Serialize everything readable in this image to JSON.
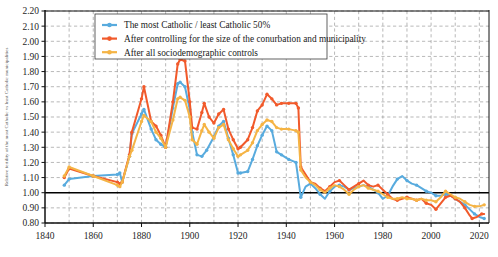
{
  "chart_data": {
    "type": "line",
    "title": "",
    "xlabel": "",
    "ylabel": "Relative fertility of the most Catholic vs least Catholic municipalities",
    "xlim": [
      1840,
      2024
    ],
    "ylim": [
      0.8,
      2.2
    ],
    "y_ticks": [
      "2.20",
      "2.10",
      "2.00",
      "1.90",
      "1.80",
      "1.70",
      "1.60",
      "1.50",
      "1.40",
      "1.30",
      "1.20",
      "1.10",
      "1.00",
      "0.90",
      "0.80"
    ],
    "x_ticks": [
      "1840",
      "1860",
      "1880",
      "1900",
      "1920",
      "1940",
      "1960",
      "1980",
      "2000",
      "2020"
    ],
    "x_minor_step": 10,
    "grid": true,
    "reference_line": 1.0,
    "legend_position": "top-center",
    "colors": {
      "series1": "#58ABDE",
      "series2": "#F15A2B",
      "series3": "#F5B445",
      "grid": "#9a9a9a",
      "axis": "#111111",
      "reference": "#000000"
    },
    "series": [
      {
        "name": "The most Catholic / least Catholic 50%",
        "color": "#58ABDE",
        "points": [
          [
            1848,
            1.05
          ],
          [
            1850,
            1.09
          ],
          [
            1860,
            1.11
          ],
          [
            1870,
            1.12
          ],
          [
            1871,
            1.13
          ],
          [
            1872,
            1.07
          ],
          [
            1875,
            1.24
          ],
          [
            1876,
            1.39
          ],
          [
            1880,
            1.52
          ],
          [
            1881,
            1.55
          ],
          [
            1884,
            1.42
          ],
          [
            1886,
            1.35
          ],
          [
            1888,
            1.32
          ],
          [
            1890,
            1.3
          ],
          [
            1893,
            1.56
          ],
          [
            1895,
            1.72
          ],
          [
            1896,
            1.73
          ],
          [
            1898,
            1.7
          ],
          [
            1900,
            1.55
          ],
          [
            1901,
            1.4
          ],
          [
            1903,
            1.25
          ],
          [
            1905,
            1.24
          ],
          [
            1907,
            1.28
          ],
          [
            1910,
            1.37
          ],
          [
            1912,
            1.44
          ],
          [
            1914,
            1.47
          ],
          [
            1916,
            1.36
          ],
          [
            1918,
            1.25
          ],
          [
            1920,
            1.13
          ],
          [
            1921,
            1.13
          ],
          [
            1924,
            1.14
          ],
          [
            1926,
            1.22
          ],
          [
            1928,
            1.31
          ],
          [
            1930,
            1.38
          ],
          [
            1932,
            1.44
          ],
          [
            1934,
            1.41
          ],
          [
            1936,
            1.27
          ],
          [
            1938,
            1.25
          ],
          [
            1941,
            1.22
          ],
          [
            1944,
            1.2
          ],
          [
            1946,
            0.97
          ],
          [
            1948,
            1.04
          ],
          [
            1950,
            1.06
          ],
          [
            1952,
            1.03
          ],
          [
            1954,
            0.99
          ],
          [
            1956,
            0.96
          ],
          [
            1958,
            1.01
          ],
          [
            1960,
            1.04
          ],
          [
            1962,
            1.05
          ],
          [
            1964,
            1.04
          ],
          [
            1966,
            1.02
          ],
          [
            1968,
            1.03
          ],
          [
            1970,
            1.04
          ],
          [
            1972,
            1.05
          ],
          [
            1974,
            1.04
          ],
          [
            1976,
            1.02
          ],
          [
            1978,
            1.0
          ],
          [
            1980,
            0.96
          ],
          [
            1982,
            0.98
          ],
          [
            1984,
            1.04
          ],
          [
            1986,
            1.09
          ],
          [
            1988,
            1.11
          ],
          [
            1990,
            1.08
          ],
          [
            1992,
            1.06
          ],
          [
            1994,
            1.05
          ],
          [
            1996,
            1.03
          ],
          [
            1998,
            1.01
          ],
          [
            2000,
            1.0
          ],
          [
            2002,
            0.98
          ],
          [
            2004,
            0.98
          ],
          [
            2006,
            0.99
          ],
          [
            2008,
            0.98
          ],
          [
            2010,
            0.96
          ],
          [
            2012,
            0.94
          ],
          [
            2014,
            0.92
          ],
          [
            2016,
            0.89
          ],
          [
            2018,
            0.86
          ],
          [
            2020,
            0.84
          ],
          [
            2022,
            0.83
          ]
        ]
      },
      {
        "name": "After controlling for the size of the conurbation and municipality",
        "color": "#F15A2B",
        "points": [
          [
            1848,
            1.1
          ],
          [
            1850,
            1.16
          ],
          [
            1860,
            1.11
          ],
          [
            1870,
            1.07
          ],
          [
            1871,
            1.06
          ],
          [
            1872,
            1.07
          ],
          [
            1875,
            1.25
          ],
          [
            1876,
            1.4
          ],
          [
            1880,
            1.62
          ],
          [
            1881,
            1.7
          ],
          [
            1884,
            1.47
          ],
          [
            1886,
            1.44
          ],
          [
            1888,
            1.38
          ],
          [
            1890,
            1.3
          ],
          [
            1893,
            1.6
          ],
          [
            1895,
            1.85
          ],
          [
            1896,
            1.88
          ],
          [
            1898,
            1.87
          ],
          [
            1900,
            1.6
          ],
          [
            1901,
            1.43
          ],
          [
            1903,
            1.42
          ],
          [
            1905,
            1.53
          ],
          [
            1906,
            1.59
          ],
          [
            1908,
            1.5
          ],
          [
            1910,
            1.46
          ],
          [
            1912,
            1.52
          ],
          [
            1914,
            1.55
          ],
          [
            1916,
            1.42
          ],
          [
            1918,
            1.35
          ],
          [
            1920,
            1.29
          ],
          [
            1921,
            1.3
          ],
          [
            1924,
            1.35
          ],
          [
            1926,
            1.43
          ],
          [
            1928,
            1.54
          ],
          [
            1930,
            1.58
          ],
          [
            1932,
            1.65
          ],
          [
            1934,
            1.62
          ],
          [
            1936,
            1.58
          ],
          [
            1938,
            1.59
          ],
          [
            1941,
            1.59
          ],
          [
            1944,
            1.59
          ],
          [
            1945,
            1.56
          ],
          [
            1946,
            1.17
          ],
          [
            1948,
            1.12
          ],
          [
            1950,
            1.07
          ],
          [
            1952,
            1.06
          ],
          [
            1954,
            1.03
          ],
          [
            1956,
            1.01
          ],
          [
            1958,
            1.04
          ],
          [
            1960,
            1.07
          ],
          [
            1962,
            1.08
          ],
          [
            1964,
            1.05
          ],
          [
            1966,
            1.02
          ],
          [
            1968,
            1.04
          ],
          [
            1970,
            1.06
          ],
          [
            1972,
            1.08
          ],
          [
            1974,
            1.05
          ],
          [
            1976,
            1.04
          ],
          [
            1978,
            1.05
          ],
          [
            1980,
            1.02
          ],
          [
            1982,
            0.99
          ],
          [
            1984,
            0.96
          ],
          [
            1986,
            0.95
          ],
          [
            1988,
            0.96
          ],
          [
            1990,
            0.97
          ],
          [
            1992,
            0.96
          ],
          [
            1994,
            0.95
          ],
          [
            1996,
            0.96
          ],
          [
            1998,
            0.93
          ],
          [
            2000,
            0.92
          ],
          [
            2002,
            0.89
          ],
          [
            2004,
            0.93
          ],
          [
            2006,
            0.97
          ],
          [
            2008,
            0.98
          ],
          [
            2010,
            0.96
          ],
          [
            2012,
            0.94
          ],
          [
            2014,
            0.9
          ],
          [
            2016,
            0.85
          ],
          [
            2017,
            0.83
          ],
          [
            2019,
            0.84
          ],
          [
            2021,
            0.86
          ],
          [
            2022,
            0.86
          ]
        ]
      },
      {
        "name": "After all sociodemographic controls",
        "color": "#F5B445",
        "points": [
          [
            1848,
            1.11
          ],
          [
            1850,
            1.17
          ],
          [
            1860,
            1.11
          ],
          [
            1870,
            1.05
          ],
          [
            1871,
            1.04
          ],
          [
            1872,
            1.07
          ],
          [
            1875,
            1.24
          ],
          [
            1876,
            1.28
          ],
          [
            1880,
            1.47
          ],
          [
            1881,
            1.51
          ],
          [
            1884,
            1.47
          ],
          [
            1886,
            1.4
          ],
          [
            1888,
            1.36
          ],
          [
            1890,
            1.3
          ],
          [
            1893,
            1.48
          ],
          [
            1895,
            1.62
          ],
          [
            1896,
            1.63
          ],
          [
            1898,
            1.61
          ],
          [
            1900,
            1.5
          ],
          [
            1901,
            1.35
          ],
          [
            1903,
            1.32
          ],
          [
            1905,
            1.41
          ],
          [
            1906,
            1.45
          ],
          [
            1908,
            1.4
          ],
          [
            1910,
            1.36
          ],
          [
            1912,
            1.43
          ],
          [
            1914,
            1.45
          ],
          [
            1916,
            1.35
          ],
          [
            1918,
            1.29
          ],
          [
            1920,
            1.24
          ],
          [
            1921,
            1.25
          ],
          [
            1924,
            1.28
          ],
          [
            1926,
            1.33
          ],
          [
            1928,
            1.41
          ],
          [
            1930,
            1.45
          ],
          [
            1932,
            1.48
          ],
          [
            1934,
            1.47
          ],
          [
            1936,
            1.43
          ],
          [
            1938,
            1.42
          ],
          [
            1941,
            1.42
          ],
          [
            1944,
            1.41
          ],
          [
            1945,
            1.4
          ],
          [
            1946,
            1.15
          ],
          [
            1948,
            1.1
          ],
          [
            1950,
            1.07
          ],
          [
            1952,
            1.05
          ],
          [
            1954,
            1.02
          ],
          [
            1956,
            1.0
          ],
          [
            1958,
            1.03
          ],
          [
            1960,
            1.05
          ],
          [
            1962,
            1.04
          ],
          [
            1964,
            1.02
          ],
          [
            1966,
            0.99
          ],
          [
            1968,
            1.02
          ],
          [
            1970,
            1.04
          ],
          [
            1972,
            1.05
          ],
          [
            1974,
            1.03
          ],
          [
            1976,
            1.02
          ],
          [
            1978,
            1.01
          ],
          [
            1980,
            0.99
          ],
          [
            1982,
            0.97
          ],
          [
            1984,
            0.96
          ],
          [
            1986,
            0.96
          ],
          [
            1988,
            0.97
          ],
          [
            1990,
            0.96
          ],
          [
            1992,
            0.96
          ],
          [
            1994,
            0.95
          ],
          [
            1996,
            0.96
          ],
          [
            1998,
            0.95
          ],
          [
            2000,
            0.95
          ],
          [
            2002,
            0.94
          ],
          [
            2004,
            0.97
          ],
          [
            2006,
            1.01
          ],
          [
            2008,
            0.99
          ],
          [
            2010,
            0.97
          ],
          [
            2012,
            0.96
          ],
          [
            2014,
            0.94
          ],
          [
            2016,
            0.92
          ],
          [
            2018,
            0.91
          ],
          [
            2020,
            0.91
          ],
          [
            2022,
            0.92
          ]
        ]
      }
    ]
  },
  "legend": {
    "items": [
      {
        "label": "The most Catholic / least Catholic 50%",
        "color": "#58ABDE"
      },
      {
        "label": "After controlling for the size of the conurbation and municipality",
        "color": "#F15A2B"
      },
      {
        "label": "After all sociodemographic controls",
        "color": "#F5B445"
      }
    ]
  }
}
